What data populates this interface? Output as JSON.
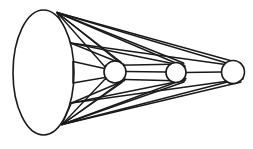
{
  "figure": {
    "canvas": {
      "width": 253,
      "height": 149
    },
    "background_color": "#ffffff",
    "stroke_color": "#1a1a1a",
    "fill_color": "#ffffff"
  },
  "chart_data": {
    "type": "diagram",
    "xlabel": "",
    "ylabel": "",
    "base_ellipse": {
      "name": "cone-base-ellipse",
      "cx": 43.5,
      "cy": 72.5,
      "rx": 30.5,
      "ry": 62.5,
      "stroke_width": 1.6
    },
    "apex_points": {
      "top_vertex": {
        "x": 57.0,
        "y": 12.5
      },
      "bottom_vertex": {
        "x": 62.0,
        "y": 124.5
      },
      "upper_mid": {
        "x": 70.5,
        "y": 43.0
      },
      "lower_mid": {
        "x": 71.5,
        "y": 103.0
      },
      "right_top": {
        "x": 73.0,
        "y": 61.5
      },
      "right_bottom": {
        "x": 73.0,
        "y": 83.0
      }
    },
    "circles": [
      {
        "name": "sphere-1",
        "cx": 115.0,
        "cy": 72.0,
        "r": 11.0,
        "stroke_width": 1.6
      },
      {
        "name": "sphere-2",
        "cx": 176.0,
        "cy": 72.5,
        "r": 10.0,
        "stroke_width": 1.6
      },
      {
        "name": "sphere-3",
        "cx": 233.0,
        "cy": 72.0,
        "r": 11.5,
        "stroke_width": 1.6
      }
    ],
    "ruling_lines": [
      {
        "x1": 57.0,
        "y1": 12.5,
        "x2": 243.5,
        "y2": 68.0,
        "w": 1.5
      },
      {
        "x1": 57.0,
        "y1": 12.5,
        "x2": 241.0,
        "y2": 63.5,
        "w": 1.5
      },
      {
        "x1": 57.0,
        "y1": 12.5,
        "x2": 185.0,
        "y2": 67.0,
        "w": 1.5
      },
      {
        "x1": 57.0,
        "y1": 12.5,
        "x2": 183.5,
        "y2": 63.0,
        "w": 1.4
      },
      {
        "x1": 57.0,
        "y1": 12.5,
        "x2": 124.0,
        "y2": 66.0,
        "w": 1.4
      },
      {
        "x1": 57.0,
        "y1": 12.5,
        "x2": 121.5,
        "y2": 62.5,
        "w": 1.4
      },
      {
        "x1": 57.0,
        "y1": 12.5,
        "x2": 106.0,
        "y2": 68.0,
        "w": 1.4
      },
      {
        "x1": 62.0,
        "y1": 124.5,
        "x2": 243.0,
        "y2": 78.0,
        "w": 1.5
      },
      {
        "x1": 62.0,
        "y1": 124.5,
        "x2": 241.0,
        "y2": 82.0,
        "w": 1.5
      },
      {
        "x1": 62.0,
        "y1": 124.5,
        "x2": 186.0,
        "y2": 78.5,
        "w": 1.5
      },
      {
        "x1": 62.0,
        "y1": 124.5,
        "x2": 184.0,
        "y2": 82.0,
        "w": 1.4
      },
      {
        "x1": 62.0,
        "y1": 124.5,
        "x2": 125.0,
        "y2": 79.0,
        "w": 1.4
      },
      {
        "x1": 62.0,
        "y1": 124.5,
        "x2": 122.0,
        "y2": 82.5,
        "w": 1.4
      },
      {
        "x1": 62.0,
        "y1": 124.5,
        "x2": 106.5,
        "y2": 77.5,
        "w": 1.4
      },
      {
        "x1": 70.5,
        "y1": 43.0,
        "x2": 243.5,
        "y2": 67.0,
        "w": 1.4
      },
      {
        "x1": 70.5,
        "y1": 43.0,
        "x2": 185.0,
        "y2": 66.0,
        "w": 1.4
      },
      {
        "x1": 70.5,
        "y1": 43.0,
        "x2": 124.0,
        "y2": 64.5,
        "w": 1.4
      },
      {
        "x1": 71.5,
        "y1": 103.0,
        "x2": 243.0,
        "y2": 79.0,
        "w": 1.4
      },
      {
        "x1": 71.5,
        "y1": 103.0,
        "x2": 185.5,
        "y2": 80.0,
        "w": 1.4
      },
      {
        "x1": 71.5,
        "y1": 103.0,
        "x2": 124.5,
        "y2": 80.5,
        "w": 1.4
      },
      {
        "x1": 73.0,
        "y1": 61.5,
        "x2": 104.5,
        "y2": 68.5,
        "w": 1.5
      },
      {
        "x1": 73.0,
        "y1": 83.0,
        "x2": 105.0,
        "y2": 77.5,
        "w": 1.5
      },
      {
        "x1": 73.0,
        "y1": 61.5,
        "x2": 73.0,
        "y2": 83.0,
        "w": 1.5
      },
      {
        "x1": 126.0,
        "y1": 71.5,
        "x2": 166.0,
        "y2": 72.0,
        "w": 1.5
      },
      {
        "x1": 186.0,
        "y1": 72.5,
        "x2": 221.5,
        "y2": 72.0,
        "w": 1.5
      },
      {
        "x1": 105.5,
        "y1": 65.5,
        "x2": 184.0,
        "y2": 64.0,
        "w": 1.4
      },
      {
        "x1": 105.5,
        "y1": 79.0,
        "x2": 184.5,
        "y2": 81.0,
        "w": 1.4
      },
      {
        "x1": 57.0,
        "y1": 12.5,
        "x2": 70.5,
        "y2": 43.0,
        "w": 1.3
      },
      {
        "x1": 62.0,
        "y1": 124.5,
        "x2": 71.5,
        "y2": 103.0,
        "w": 1.3
      }
    ],
    "legend": [],
    "annotations": [],
    "grid": false
  }
}
